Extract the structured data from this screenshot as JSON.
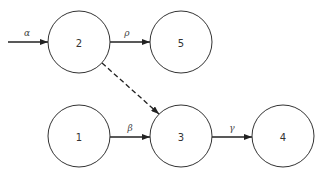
{
  "diagram": {
    "type": "directed-graph",
    "nodes": [
      {
        "id": "2",
        "label": "2",
        "cx": 79,
        "cy": 42,
        "r": 31
      },
      {
        "id": "5",
        "label": "5",
        "cx": 181,
        "cy": 42,
        "r": 31
      },
      {
        "id": "1",
        "label": "1",
        "cx": 79,
        "cy": 136,
        "r": 31
      },
      {
        "id": "3",
        "label": "3",
        "cx": 181,
        "cy": 136,
        "r": 31
      },
      {
        "id": "4",
        "label": "4",
        "cx": 283,
        "cy": 136,
        "r": 31
      }
    ],
    "edges": [
      {
        "from": "input",
        "to": "2",
        "label": "α",
        "style": "solid"
      },
      {
        "from": "2",
        "to": "5",
        "label": "ρ",
        "style": "solid"
      },
      {
        "from": "2",
        "to": "3",
        "label": "",
        "style": "dashed"
      },
      {
        "from": "1",
        "to": "3",
        "label": "β",
        "style": "solid"
      },
      {
        "from": "3",
        "to": "4",
        "label": "γ",
        "style": "solid"
      }
    ]
  }
}
